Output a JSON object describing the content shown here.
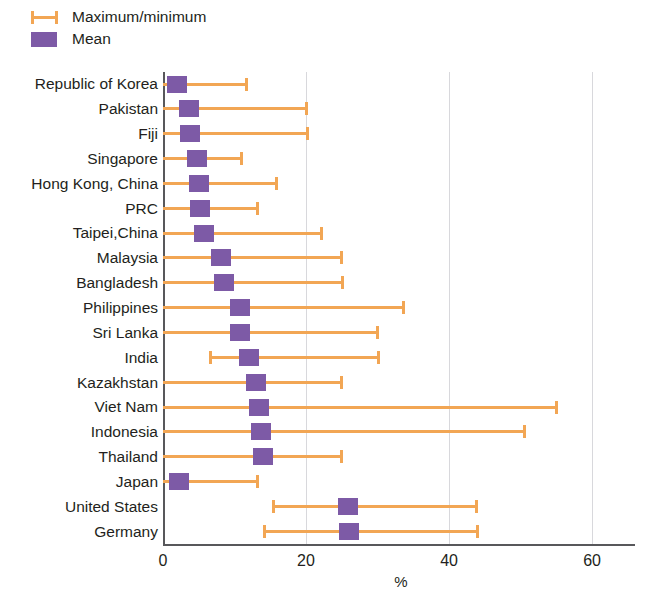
{
  "legend": {
    "items": [
      {
        "label": "Maximum/minimum",
        "icon": "whisker-icon",
        "color": "#f2a654"
      },
      {
        "label": "Mean",
        "icon": "square-swatch-icon",
        "color": "#7d5aa6"
      }
    ]
  },
  "colors": {
    "whisker": "#f2a654",
    "mean": "#7d5aa6",
    "axis": "#58585b",
    "grid": "#d8d8dc"
  },
  "chart_data": {
    "type": "bar",
    "subtype": "range-with-mean-marker",
    "title": "",
    "xlabel": "%",
    "ylabel": "",
    "xlim": [
      0,
      66
    ],
    "xticks": [
      0,
      20,
      40,
      60
    ],
    "xtick_labels": [
      "0",
      "20",
      "40",
      "60"
    ],
    "grid": true,
    "grid_axis": "x",
    "legend_position": "top-left",
    "categories": [
      "Republic of Korea",
      "Pakistan",
      "Fiji",
      "Singapore",
      "Hong Kong, China",
      "PRC",
      "Taipei,China",
      "Malaysia",
      "Bangladesh",
      "Philippines",
      "Sri Lanka",
      "India",
      "Kazakhstan",
      "Viet Nam",
      "Indonesia",
      "Thailand",
      "Japan",
      "United States",
      "Germany"
    ],
    "series": [
      {
        "name": "Minimum",
        "values": [
          0,
          0,
          0,
          0,
          0,
          0,
          0,
          0,
          0,
          0,
          0,
          6.5,
          0,
          0,
          0,
          0,
          0,
          15.3,
          14.0
        ]
      },
      {
        "name": "Mean",
        "values": [
          2.0,
          3.6,
          3.8,
          4.7,
          5.0,
          5.2,
          5.7,
          8.1,
          8.5,
          10.7,
          10.8,
          12.0,
          13.0,
          13.4,
          13.7,
          14.0,
          2.2,
          25.9,
          26.0
        ]
      },
      {
        "name": "Maximum",
        "values": [
          11.7,
          20.2,
          20.3,
          11.0,
          16.0,
          13.3,
          22.3,
          25.0,
          25.2,
          33.7,
          30.0,
          30.2,
          25.0,
          55.1,
          50.6,
          25.0,
          13.3,
          43.9,
          44.0
        ]
      }
    ]
  }
}
